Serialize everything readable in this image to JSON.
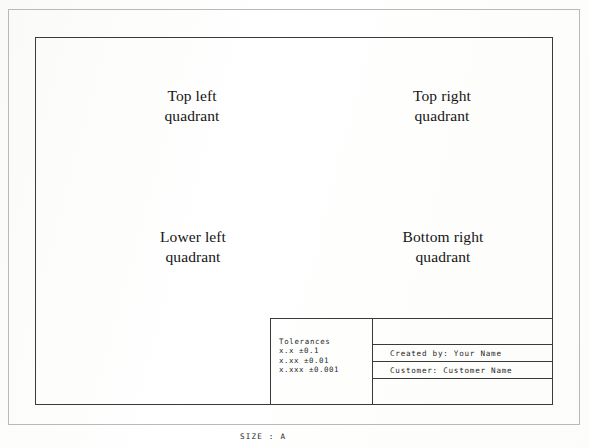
{
  "sheet": {
    "size_caption": "SIZE : A",
    "border_color": "#3a3a3a",
    "outer_border_color": "#b9b9b9",
    "background_color": "#fdfdfc",
    "text_color": "#151515"
  },
  "quadrants": [
    {
      "name": "top-left",
      "line1": "Top left",
      "line2": "quadrant"
    },
    {
      "name": "top-right",
      "line1": "Top right",
      "line2": "quadrant"
    },
    {
      "name": "lower-left",
      "line1": "Lower left",
      "line2": "quadrant"
    },
    {
      "name": "bottom-right",
      "line1": "Bottom right",
      "line2": "quadrant"
    }
  ],
  "title_block": {
    "tolerances": {
      "heading": "Tolerances",
      "rows": [
        "x.x ±0.1",
        "x.xx ±0.01",
        "x.xxx ±0.001"
      ]
    },
    "info_rows": [
      {
        "name": "blank-top",
        "text": ""
      },
      {
        "name": "created-by",
        "text": "Created by: Your Name"
      },
      {
        "name": "customer",
        "text": "Customer: Customer Name"
      },
      {
        "name": "blank-bottom",
        "text": ""
      }
    ]
  }
}
